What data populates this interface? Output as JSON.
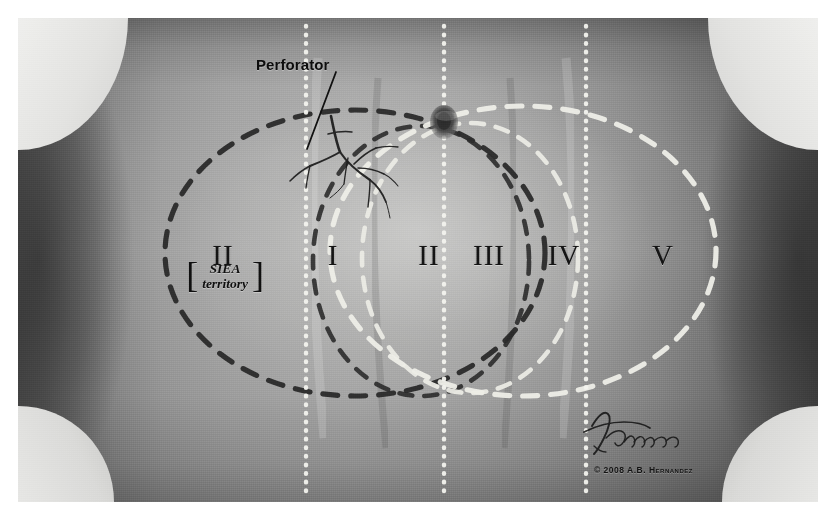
{
  "figure": {
    "kind": "medical-illustration",
    "frame_bg": "#ffffff"
  },
  "annotations": {
    "perforator_label": "Perforator",
    "siea_bracket_open": "[",
    "siea_bracket_close": "]",
    "siea_line1": "SIEA",
    "siea_line2": "territory",
    "copyright": "© 2008 A.B. Hernandez",
    "signature_name": "A.B. Hernandez"
  },
  "zones": [
    {
      "id": "zone-2-left",
      "label": "II",
      "x": 205,
      "y": 237,
      "side": "left"
    },
    {
      "id": "zone-1",
      "label": "I",
      "x": 315,
      "y": 237,
      "side": "left"
    },
    {
      "id": "zone-2-right",
      "label": "II",
      "x": 411,
      "y": 237,
      "side": "right"
    },
    {
      "id": "zone-3",
      "label": "III",
      "x": 471,
      "y": 237,
      "side": "right"
    },
    {
      "id": "zone-4",
      "label": "IV",
      "x": 546,
      "y": 237,
      "side": "right"
    },
    {
      "id": "zone-5",
      "label": "V",
      "x": 645,
      "y": 237,
      "side": "right"
    }
  ],
  "guides": {
    "vertical_dotted_lines": [
      {
        "id": "guide-left",
        "x": 288,
        "color": "#f2f2ee"
      },
      {
        "id": "guide-midline",
        "x": 426,
        "color": "#f2f2ee"
      },
      {
        "id": "guide-right",
        "x": 568,
        "color": "#f2f2ee"
      }
    ],
    "dotted_color": "#f2f2ee"
  },
  "territories": [
    {
      "id": "ellipse-outer-dark",
      "style": "dashed",
      "color": "#2a2a2a",
      "cx": 337,
      "cy": 235,
      "rx": 190,
      "ry": 143
    },
    {
      "id": "ellipse-inner-dark",
      "style": "dashed",
      "color": "#2a2a2a",
      "cx": 403,
      "cy": 243,
      "rx": 108,
      "ry": 135
    },
    {
      "id": "ellipse-inner-light",
      "style": "dashed",
      "color": "#e8e8e2",
      "cx": 452,
      "cy": 240,
      "rx": 108,
      "ry": 135
    },
    {
      "id": "ellipse-outer-light",
      "style": "dashed",
      "color": "#e8e8e2",
      "cx": 505,
      "cy": 233,
      "rx": 193,
      "ry": 145
    }
  ],
  "anatomy": {
    "umbilicus": {
      "cx": 426,
      "cy": 104,
      "rx": 13,
      "ry": 16
    },
    "perforator_vessel_color": "#1c1c1c",
    "pointer_line": {
      "x1": 316,
      "y1": 57,
      "x2": 288,
      "y2": 130
    }
  },
  "colors": {
    "skin_mid": "#adadad",
    "skin_shadow": "#4b4b4b",
    "dark_dash": "#2a2a2a",
    "light_dash": "#e8e8e2",
    "label_ink": "#141414"
  }
}
